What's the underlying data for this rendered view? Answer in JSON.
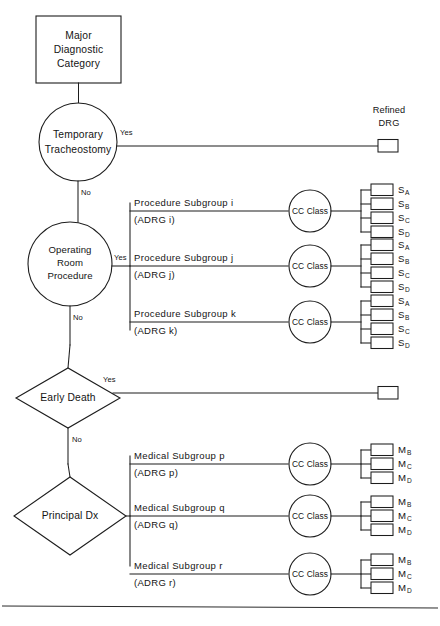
{
  "diagram": {
    "root_node": {
      "name": "major-diagnostic-category",
      "lines": [
        "Major",
        "Diagnostic",
        "Category"
      ]
    },
    "column_header": {
      "lines": [
        "Refined",
        "DRG"
      ]
    },
    "branch_labels": {
      "yes": "Yes",
      "no": "No"
    },
    "cc_class_label": "CC Class",
    "decisions": [
      {
        "id": "temporary-tracheostomy",
        "shape": "circle",
        "lines": [
          "Temporary",
          "Tracheostomy"
        ]
      },
      {
        "id": "operating-room-procedure",
        "shape": "circle",
        "lines": [
          "Operating",
          "Room",
          "Procedure"
        ]
      },
      {
        "id": "early-death",
        "shape": "diamond",
        "lines": [
          "Early Death"
        ]
      },
      {
        "id": "principal-dx",
        "shape": "diamond",
        "lines": [
          "Principal Dx"
        ]
      }
    ],
    "surgical_subgroups": [
      {
        "id": "procedure-subgroup-i",
        "title": "Procedure  Subgroup i",
        "adrg": "(ADRG i)",
        "outcomes": [
          {
            "base": "S",
            "sub": "A"
          },
          {
            "base": "S",
            "sub": "B"
          },
          {
            "base": "S",
            "sub": "C"
          },
          {
            "base": "S",
            "sub": "D"
          }
        ]
      },
      {
        "id": "procedure-subgroup-j",
        "title": "Procedure  Subgroup j",
        "adrg": "(ADRG j)",
        "outcomes": [
          {
            "base": "S",
            "sub": "A"
          },
          {
            "base": "S",
            "sub": "B"
          },
          {
            "base": "S",
            "sub": "C"
          },
          {
            "base": "S",
            "sub": "D"
          }
        ]
      },
      {
        "id": "procedure-subgroup-k",
        "title": "Procedure  Subgroup k",
        "adrg": "(ADRG k)",
        "outcomes": [
          {
            "base": "S",
            "sub": "A"
          },
          {
            "base": "S",
            "sub": "B"
          },
          {
            "base": "S",
            "sub": "C"
          },
          {
            "base": "S",
            "sub": "D"
          }
        ]
      }
    ],
    "medical_subgroups": [
      {
        "id": "medical-subgroup-p",
        "title": "Medical  Subgroup p",
        "adrg": "(ADRG p)",
        "outcomes": [
          {
            "base": "M",
            "sub": "B"
          },
          {
            "base": "M",
            "sub": "C"
          },
          {
            "base": "M",
            "sub": "D"
          }
        ]
      },
      {
        "id": "medical-subgroup-q",
        "title": "Medical  Subgroup q",
        "adrg": "(ADRG q)",
        "outcomes": [
          {
            "base": "M",
            "sub": "B"
          },
          {
            "base": "M",
            "sub": "C"
          },
          {
            "base": "M",
            "sub": "D"
          }
        ]
      },
      {
        "id": "medical-subgroup-r",
        "title": "Medical  Subgroup r",
        "adrg": "(ADRG r)",
        "outcomes": [
          {
            "base": "M",
            "sub": "B"
          },
          {
            "base": "M",
            "sub": "C"
          },
          {
            "base": "M",
            "sub": "D"
          }
        ]
      }
    ],
    "colors": {
      "stroke": "#1d1d1d",
      "background": "#ffffff",
      "text": "#141414"
    }
  }
}
